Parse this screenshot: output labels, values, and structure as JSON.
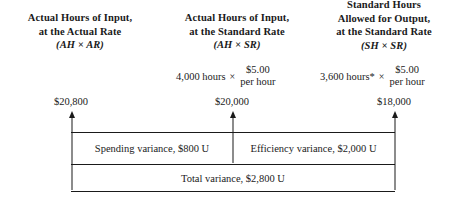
{
  "diagram": {
    "columns": [
      {
        "id": "actual-hours-actual-rate",
        "title_line1": "Actual Hours of Input,",
        "title_line2": "at the Actual Rate",
        "title_line3": "",
        "abbreviation": "(AH × AR)",
        "amount": "$20,800"
      },
      {
        "id": "actual-hours-standard-rate",
        "title_line1": "Actual Hours of Input,",
        "title_line2": "at the Standard Rate",
        "title_line3": "",
        "abbreviation": "(AH × SR)",
        "hours": "4,000 hours",
        "times": "×",
        "rate_numerator": "$5.00",
        "rate_denominator": "per hour",
        "amount": "$20,000"
      },
      {
        "id": "standard-hours-standard-rate",
        "title_line1": "Standard Hours",
        "title_line2": "Allowed for Output,",
        "title_line3": "at the Standard Rate",
        "abbreviation": "(SH × SR)",
        "hours": "3,600 hours*",
        "times": "×",
        "rate_numerator": "$5.00",
        "rate_denominator": "per hour",
        "amount": "$18,000"
      }
    ],
    "variances": [
      {
        "id": "spending",
        "label": "Spending variance, $800 U"
      },
      {
        "id": "efficiency",
        "label": "Efficiency variance, $2,000 U"
      },
      {
        "id": "total",
        "label": "Total variance, $2,800 U"
      }
    ],
    "colors": {
      "line": "#1a1a1a",
      "text": "#1a1a1a",
      "background": "#ffffff"
    }
  }
}
